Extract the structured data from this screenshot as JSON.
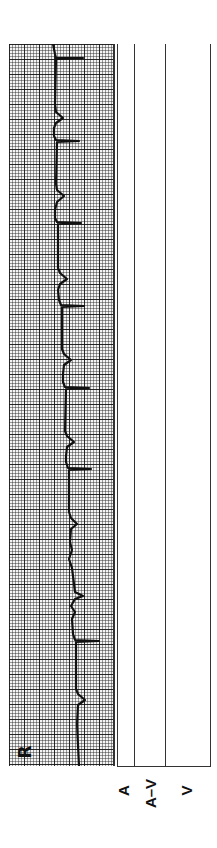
{
  "strip": {
    "lead_label": "R",
    "grid": {
      "minor_px": 3,
      "major_px": 15,
      "color": "#222222",
      "paper": "#f4f4f4"
    },
    "trace_color": "#111111",
    "qrs_positions_y": [
      58,
      140,
      222,
      305,
      385,
      468,
      548,
      697
    ],
    "p_wave_positions_y": [
      115,
      195,
      270,
      345,
      430,
      510,
      600,
      655,
      755
    ]
  },
  "lanes": {
    "labels": [
      "A",
      "A–V",
      "V"
    ]
  }
}
